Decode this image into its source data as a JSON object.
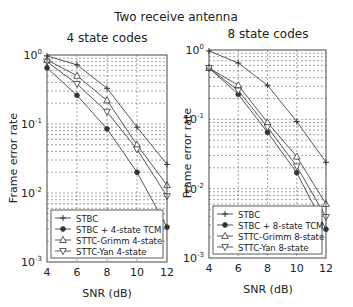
{
  "figure": {
    "suptitle": "Two receive antenna"
  },
  "chart_data": [
    {
      "type": "line",
      "title": "4 state codes",
      "xlabel": "SNR (dB)",
      "ylabel": "Frame error rate",
      "yscale": "log",
      "x": [
        4,
        6,
        8,
        10,
        12
      ],
      "xticks": [
        "4",
        "6",
        "8",
        "10",
        "12"
      ],
      "yticks": [
        "10^0",
        "10^-1",
        "10^-2",
        "10^-3"
      ],
      "xlim": [
        4,
        12
      ],
      "ylim": [
        0.001,
        1
      ],
      "grid": true,
      "legend_position": "lower left",
      "series": [
        {
          "name": "STBC",
          "marker": "plus",
          "values": [
            0.97,
            0.72,
            0.33,
            0.09,
            0.026
          ]
        },
        {
          "name": "STBC + 4-state TCM",
          "marker": "circle-filled",
          "values": [
            0.65,
            0.26,
            0.085,
            0.02,
            0.0032
          ]
        },
        {
          "name": "STTC-Grimm 4-state",
          "marker": "triangle-up",
          "values": [
            0.85,
            0.5,
            0.22,
            0.05,
            0.013
          ]
        },
        {
          "name": "STTC-Yan 4-state",
          "marker": "triangle-down",
          "values": [
            0.8,
            0.38,
            0.15,
            0.043,
            0.009
          ]
        }
      ]
    },
    {
      "type": "line",
      "title": "8 state codes",
      "xlabel": "SNR (dB)",
      "ylabel": "Frame error rate",
      "yscale": "log",
      "x": [
        4,
        6,
        8,
        10,
        12
      ],
      "xticks": [
        "4",
        "6",
        "8",
        "10",
        "12"
      ],
      "yticks": [
        "10^0",
        "10^-1",
        "10^-2",
        "10^-3"
      ],
      "xlim": [
        4,
        12
      ],
      "ylim": [
        0.001,
        1
      ],
      "grid": true,
      "legend_position": "lower left",
      "series": [
        {
          "name": "STBC",
          "marker": "plus",
          "values": [
            0.97,
            0.65,
            0.31,
            0.093,
            0.024
          ]
        },
        {
          "name": "STBC + 8-state TCM",
          "marker": "circle-filled",
          "values": [
            0.55,
            0.23,
            0.065,
            0.017,
            0.0026
          ]
        },
        {
          "name": "STTC-Grimm 8-state",
          "marker": "triangle-up",
          "values": [
            0.55,
            0.31,
            0.09,
            0.029,
            0.006
          ]
        },
        {
          "name": "STTC-Yan 8-state",
          "marker": "triangle-down",
          "values": [
            0.55,
            0.26,
            0.077,
            0.021,
            0.0039
          ]
        }
      ]
    }
  ]
}
